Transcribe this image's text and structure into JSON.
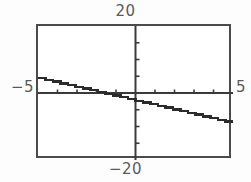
{
  "figure": {
    "frame": {
      "x": 36,
      "y": 24,
      "width": 195,
      "height": 134
    },
    "frame_color": "#4b4b4b",
    "axis_color": "#3a3a3a",
    "curve_color": "#2b2b2b",
    "background": "#ffffff",
    "labels": {
      "y_max": "20",
      "y_min": "−20",
      "x_min": "−5",
      "x_max": "5"
    }
  },
  "chart_data": {
    "type": "line",
    "title": "",
    "xlabel": "",
    "ylabel": "",
    "xlim": [
      -5,
      5
    ],
    "ylim": [
      -20,
      20
    ],
    "xtick_labels": [
      "−5",
      "5"
    ],
    "ytick_labels": [
      "−20",
      "20"
    ],
    "xticks": [
      -4,
      -3,
      -2,
      -1,
      1,
      2,
      3,
      4
    ],
    "yticks": [
      -15,
      -10,
      -5,
      5,
      10,
      15
    ],
    "grid": false,
    "legend": false,
    "axes_style": "centered-cross",
    "series": [
      {
        "name": "line",
        "slope": -1.35,
        "intercept": -2.3,
        "x": [
          -5,
          -4,
          -3,
          -2,
          -1,
          0,
          1,
          2,
          3,
          4,
          5
        ],
        "y": [
          4.45,
          3.1,
          1.75,
          0.4,
          -0.95,
          -2.3,
          -3.65,
          -5.0,
          -6.35,
          -7.7,
          -9.05
        ],
        "x_intercept": -1.7,
        "y_intercept": -2.3
      }
    ]
  }
}
